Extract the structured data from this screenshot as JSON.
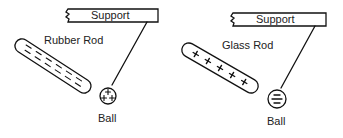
{
  "panels": [
    {
      "support_label": "Support",
      "rod_label": "Rubber Rod",
      "rod_charge": "negative",
      "rod_charge_symbols": [
        "-",
        "-",
        "-",
        "-",
        "-",
        "-",
        "-",
        "-",
        "-",
        "-",
        "-",
        "-"
      ],
      "ball_label": "Ball",
      "ball_charge": "positive",
      "ball_charge_symbols": [
        "+",
        "+",
        "+"
      ]
    },
    {
      "support_label": "Support",
      "rod_label": "Glass Rod",
      "rod_charge": "positive",
      "rod_charge_symbols": [
        "+",
        "+",
        "+",
        "+",
        "+"
      ],
      "ball_label": "Ball",
      "ball_charge": "negative",
      "ball_charge_symbols": [
        "-",
        "-",
        "-"
      ]
    }
  ],
  "colors": {
    "line": "#111111",
    "text": "#222222",
    "background": "#ffffff"
  }
}
